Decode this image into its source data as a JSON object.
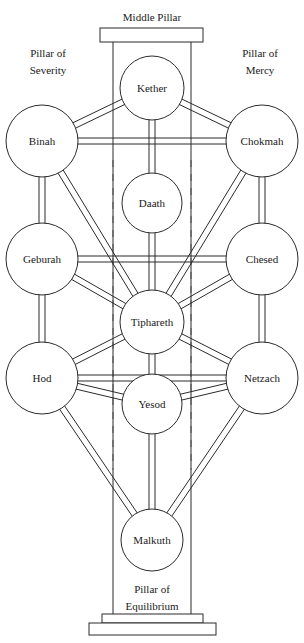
{
  "diagram": {
    "background_color": "#ffffff",
    "line_color": "#2b2b2b",
    "text_color": "#1a1a1a"
  },
  "pillars": {
    "middle": {
      "label": "Middle Pillar",
      "x": 152,
      "y": 17
    },
    "left": {
      "line1": "Pillar of",
      "line2": "Severity",
      "x": 48,
      "y1": 53,
      "y2": 70
    },
    "right": {
      "line1": "Pillar of",
      "line2": "Mercy",
      "x": 260,
      "y1": 53,
      "y2": 70
    },
    "bottom": {
      "line1": "Pillar of",
      "line2": "Equilibrium",
      "x": 152,
      "y1": 589,
      "y2": 606
    }
  },
  "column": {
    "capital": {
      "x": 100,
      "y": 28,
      "width": 103,
      "height": 14
    },
    "shaft_left_x": 113,
    "shaft_right_x": 191,
    "shaft_top_y": 42,
    "shaft_bottom_y": 614,
    "plinth_upper": {
      "x": 102,
      "y": 614,
      "width": 101,
      "height": 9
    },
    "plinth_lower": {
      "x": 89,
      "y": 623,
      "width": 127,
      "height": 12
    }
  },
  "guides": {
    "dash_left_x": 113,
    "dash_right_x": 191,
    "dash_top_y": 160,
    "dash_bottom_y": 470
  },
  "sephiroth": [
    {
      "id": "kether",
      "label": "Kether",
      "cx": 152,
      "cy": 88,
      "r": 32
    },
    {
      "id": "binah",
      "label": "Binah",
      "cx": 42,
      "cy": 141,
      "r": 36
    },
    {
      "id": "chokmah",
      "label": "Chokmah",
      "cx": 262,
      "cy": 141,
      "r": 36
    },
    {
      "id": "daath",
      "label": "Daath",
      "cx": 152,
      "cy": 203,
      "r": 30
    },
    {
      "id": "geburah",
      "label": "Geburah",
      "cx": 42,
      "cy": 259,
      "r": 36
    },
    {
      "id": "chesed",
      "label": "Chesed",
      "cx": 262,
      "cy": 259,
      "r": 36
    },
    {
      "id": "tiphareth",
      "label": "Tiphareth",
      "cx": 152,
      "cy": 322,
      "r": 32
    },
    {
      "id": "hod",
      "label": "Hod",
      "cx": 42,
      "cy": 378,
      "r": 36
    },
    {
      "id": "netzach",
      "label": "Netzach",
      "cx": 262,
      "cy": 378,
      "r": 36
    },
    {
      "id": "yesod",
      "label": "Yesod",
      "cx": 152,
      "cy": 404,
      "r": 30
    },
    {
      "id": "malkuth",
      "label": "Malkuth",
      "cx": 152,
      "cy": 540,
      "r": 31
    }
  ],
  "paths": [
    {
      "from": "kether",
      "to": "binah"
    },
    {
      "from": "kether",
      "to": "chokmah"
    },
    {
      "from": "kether",
      "to": "daath"
    },
    {
      "from": "binah",
      "to": "chokmah"
    },
    {
      "from": "binah",
      "to": "geburah"
    },
    {
      "from": "binah",
      "to": "tiphareth"
    },
    {
      "from": "chokmah",
      "to": "chesed"
    },
    {
      "from": "chokmah",
      "to": "tiphareth"
    },
    {
      "from": "daath",
      "to": "tiphareth"
    },
    {
      "from": "geburah",
      "to": "chesed"
    },
    {
      "from": "geburah",
      "to": "tiphareth"
    },
    {
      "from": "geburah",
      "to": "hod"
    },
    {
      "from": "chesed",
      "to": "tiphareth"
    },
    {
      "from": "chesed",
      "to": "netzach"
    },
    {
      "from": "tiphareth",
      "to": "hod"
    },
    {
      "from": "tiphareth",
      "to": "netzach"
    },
    {
      "from": "tiphareth",
      "to": "yesod"
    },
    {
      "from": "hod",
      "to": "netzach"
    },
    {
      "from": "hod",
      "to": "yesod"
    },
    {
      "from": "hod",
      "to": "malkuth"
    },
    {
      "from": "netzach",
      "to": "yesod"
    },
    {
      "from": "netzach",
      "to": "malkuth"
    },
    {
      "from": "yesod",
      "to": "malkuth"
    }
  ],
  "path_style": {
    "channel_width": 6
  }
}
